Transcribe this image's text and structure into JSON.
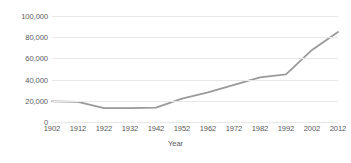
{
  "chart_data": {
    "type": "line",
    "title": "",
    "xlabel": "Year",
    "ylabel": "",
    "grid": true,
    "legend": false,
    "xlim": [
      1902,
      2012
    ],
    "ylim": [
      0,
      100000
    ],
    "x": [
      1902,
      1912,
      1922,
      1932,
      1942,
      1952,
      1962,
      1972,
      1982,
      1992,
      2002,
      2012
    ],
    "categories": [
      "1902",
      "1912",
      "1922",
      "1932",
      "1942",
      "1952",
      "1962",
      "1972",
      "1982",
      "1992",
      "2002",
      "2012"
    ],
    "values": [
      19500,
      19000,
      13000,
      13000,
      13500,
      22000,
      28000,
      35000,
      42000,
      45000,
      68000,
      85000
    ],
    "series": [
      {
        "name": "",
        "color": "#9a9a9a",
        "values": [
          19500,
          19000,
          13000,
          13000,
          13500,
          22000,
          28000,
          35000,
          42000,
          45000,
          68000,
          85000
        ]
      }
    ],
    "y_ticks": [
      0,
      20000,
      40000,
      60000,
      80000,
      100000
    ],
    "y_tick_labels": [
      "0",
      "20,000",
      "40,000",
      "60,000",
      "80,000",
      "100,000"
    ],
    "x_tick_labels": [
      "1902",
      "1912",
      "1922",
      "1932",
      "1942",
      "1952",
      "1962",
      "1972",
      "1982",
      "1992",
      "2002",
      "2012"
    ],
    "line_color": "#9a9a9a",
    "grid_color": "#e8e8e8",
    "text_color": "#5a5a5a"
  }
}
